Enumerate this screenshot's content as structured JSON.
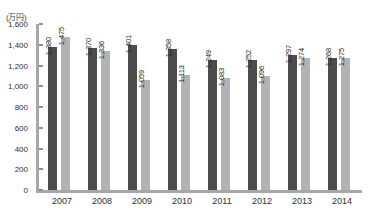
{
  "chart_data": {
    "type": "bar",
    "title": "",
    "subtitle": "",
    "xlabel": "",
    "ylabel": "(万円)",
    "unit_label": "(万円)",
    "categories": [
      "2007",
      "2008",
      "2009",
      "2010",
      "2011",
      "2012",
      "2013",
      "2014"
    ],
    "series": [
      {
        "name": "series-dark",
        "color": "#4c4c4c",
        "values": [
          1380,
          1370,
          1401,
          1358,
          1249,
          1252,
          1297,
          1268
        ],
        "labels": [
          "1,380",
          "1,370",
          "1,401",
          "1,358",
          "1,249",
          "1,252",
          "1,297",
          "1,268"
        ]
      },
      {
        "name": "series-light",
        "color": "#b3b3b3",
        "values": [
          1475,
          1336,
          1059,
          1113,
          1083,
          1096,
          1274,
          1275
        ],
        "labels": [
          "1,475",
          "1,336",
          "1,059",
          "1,113",
          "1,083",
          "1,096",
          "1,274",
          "1,275"
        ]
      }
    ],
    "ylim": [
      0,
      1600
    ],
    "yticks": [
      0,
      200,
      400,
      600,
      800,
      1000,
      1200,
      1400,
      1600
    ],
    "ytick_labels": [
      "0",
      "200",
      "400",
      "600",
      "800",
      "1,000",
      "1,200",
      "1,400",
      "1,600"
    ],
    "grid": false,
    "legend": "none",
    "axis_color": "#a7a7a7"
  }
}
